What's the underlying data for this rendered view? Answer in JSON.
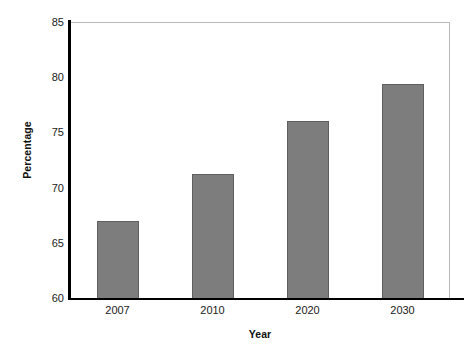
{
  "chart_data": {
    "type": "bar",
    "title": "",
    "subtitle": "",
    "categories": [
      "2007",
      "2010",
      "2020",
      "2030"
    ],
    "values": [
      67,
      71.2,
      76,
      79.4
    ],
    "xlabel": "Year",
    "ylabel": "Percentage",
    "ylim": [
      60,
      85
    ],
    "yticks": [
      60,
      65,
      70,
      75,
      80,
      85
    ],
    "ytick_labels": [
      "60",
      "65",
      "70",
      "75",
      "80",
      "85"
    ],
    "grid": false,
    "legend": false,
    "legend_position": "none",
    "bar_color": "#7d7d7d",
    "bar_edge_color": "#5f5f5f",
    "axis_color": "#000000",
    "frame_color": "#b8b8b8",
    "background": "#ffffff",
    "annotations": []
  }
}
